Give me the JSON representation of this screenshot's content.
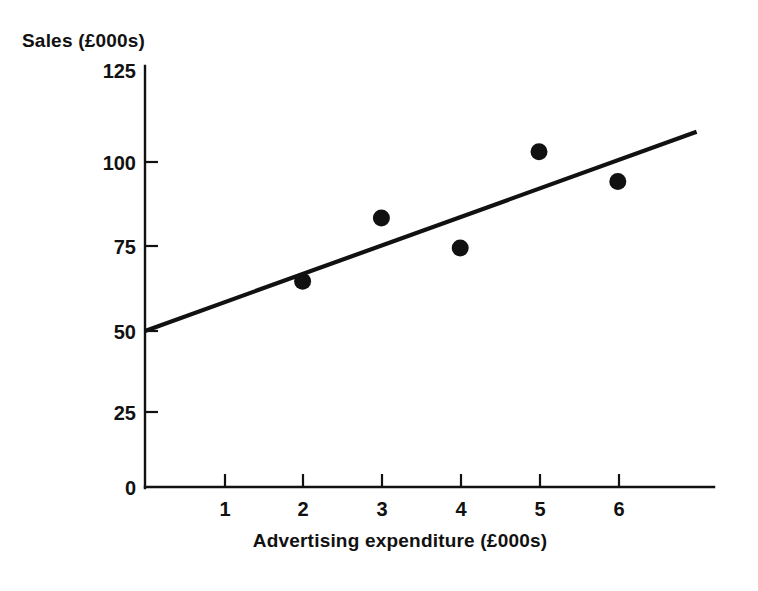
{
  "chart_data": {
    "type": "scatter",
    "title": "",
    "xlabel": "Advertising expenditure (£000s)",
    "ylabel": "Sales (£000s)",
    "x": [
      2,
      3,
      4,
      5,
      6
    ],
    "values": [
      62,
      81,
      72,
      101,
      92
    ],
    "points": [
      {
        "x": 2,
        "y": 62
      },
      {
        "x": 3,
        "y": 81
      },
      {
        "x": 4,
        "y": 72
      },
      {
        "x": 5,
        "y": 101
      },
      {
        "x": 6,
        "y": 92
      }
    ],
    "series": [
      {
        "name": "Sales observations",
        "type": "scatter",
        "x": [
          2,
          3,
          4,
          5,
          6
        ],
        "values": [
          62,
          81,
          72,
          101,
          92
        ]
      },
      {
        "name": "Regression line",
        "type": "line",
        "x": [
          0,
          7
        ],
        "values": [
          47,
          107
        ]
      }
    ],
    "regression_line": {
      "x_start": 0,
      "y_start": 47,
      "x_end": 7,
      "y_end": 107
    },
    "xlim": [
      0,
      7.2
    ],
    "ylim": [
      0,
      125
    ],
    "xticks": [
      1,
      2,
      3,
      4,
      5,
      6
    ],
    "xtick_labels": [
      "1",
      "2",
      "3",
      "4",
      "5",
      "6"
    ],
    "yticks": [
      0,
      25,
      50,
      75,
      100,
      125
    ],
    "ytick_labels": [
      "0",
      "25",
      "50",
      "75",
      "100",
      "125"
    ],
    "grid": false,
    "legend": false,
    "legend_position": "none",
    "marker": "filled-circle",
    "marker_color": "#111111",
    "line_color": "#111111"
  },
  "axes": {
    "y_axis_title": "Sales (£000s)",
    "x_axis_title": "Advertising expenditure (£000s)"
  },
  "colors": {
    "ink": "#111111",
    "background": "#ffffff"
  },
  "caption": {
    "text": ""
  }
}
